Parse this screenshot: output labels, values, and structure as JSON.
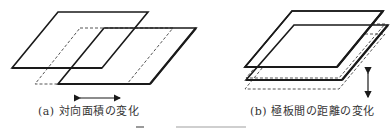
{
  "figure": {
    "panel_a": {
      "caption": "(a) 対向面積の変化",
      "description": "Two overlapping parallel plates; one plate shifted horizontally (dashed = original position)",
      "arrow": "horizontal double-headed arrow"
    },
    "panel_b": {
      "caption": "(b) 極板間の距離の変化",
      "description": "Two stacked parallel plates; lower plate moved vertically (dashed = alternate positions)",
      "arrow": "vertical double-headed arrow"
    },
    "colors": {
      "stroke": "#1a1a1a",
      "dashed": "#555555",
      "background": "#ffffff"
    }
  }
}
